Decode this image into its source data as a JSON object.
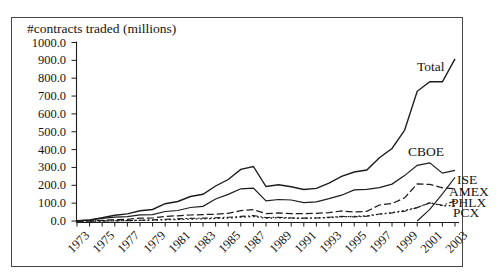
{
  "figure": {
    "title": "#contracts traded (millions)",
    "frame_color": "#474747",
    "line_color": "#1c1c1c"
  },
  "y_axis": {
    "ticks": [
      "1000.0",
      "900.0",
      "800.0",
      "700.0",
      "600.0",
      "500.0",
      "400.0",
      "300.0",
      "200.0",
      "100.0",
      "0.0"
    ]
  },
  "x_axis": {
    "labels": [
      "1973",
      "1975",
      "1977",
      "1979",
      "1981",
      "1983",
      "1985",
      "1987",
      "1989",
      "1991",
      "1993",
      "1995",
      "1997",
      "1999",
      "2001",
      "2003"
    ]
  },
  "series_labels": {
    "total": "Total",
    "cboe": "CBOE",
    "ise": "ISE",
    "amex": "AMEX",
    "phlx": "PHLX",
    "pcx": "PCX"
  },
  "chart_data": {
    "type": "line",
    "title": "#contracts traded (millions)",
    "xlabel": "",
    "ylabel": "#contracts traded (millions)",
    "ylim": [
      0,
      1000
    ],
    "xlim": [
      1973,
      2003
    ],
    "grid": false,
    "legend_position": "inline-annotations",
    "x": [
      1973,
      1974,
      1975,
      1976,
      1977,
      1978,
      1979,
      1980,
      1981,
      1982,
      1983,
      1984,
      1985,
      1986,
      1987,
      1988,
      1989,
      1990,
      1991,
      1992,
      1993,
      1994,
      1995,
      1996,
      1997,
      1998,
      1999,
      2000,
      2001,
      2002,
      2003
    ],
    "series": [
      {
        "name": "Total",
        "line_style": "solid",
        "values": [
          1.1,
          5.7,
          18.1,
          32.4,
          39.6,
          57.2,
          64.3,
          96.7,
          109.4,
          137.3,
          149.4,
          196.1,
          232.5,
          289.2,
          305.1,
          193.0,
          203.5,
          191.4,
          176.2,
          182.7,
          212.4,
          250.2,
          274.5,
          285.8,
          354.7,
          406.3,
          507.9,
          726.7,
          781.2,
          779.8,
          908.4
        ]
      },
      {
        "name": "CBOE",
        "line_style": "solid",
        "values": [
          1.1,
          5.7,
          14.4,
          21.5,
          24.8,
          34.3,
          35.4,
          53.2,
          58.8,
          75.7,
          82.4,
          123.2,
          148.8,
          180.2,
          184.1,
          112.5,
          120.5,
          117.4,
          103.0,
          107.1,
          125.0,
          144.8,
          174.4,
          176.8,
          187.3,
          206.7,
          254.3,
          312.2,
          325.9,
          267.6,
          283.9
        ]
      },
      {
        "name": "ISE",
        "line_style": "solid",
        "values": [
          null,
          null,
          null,
          null,
          null,
          null,
          null,
          null,
          null,
          null,
          null,
          null,
          null,
          null,
          null,
          null,
          null,
          null,
          null,
          null,
          null,
          null,
          null,
          null,
          null,
          null,
          null,
          0.0,
          65.0,
          152.4,
          245.0
        ]
      },
      {
        "name": "AMEX",
        "line_style": "dashed",
        "values": [
          0.0,
          0.0,
          3.5,
          8.0,
          9.8,
          15.5,
          17.0,
          25.7,
          29.4,
          33.8,
          35.8,
          38.3,
          43.2,
          58.1,
          63.5,
          41.5,
          45.0,
          41.0,
          41.7,
          42.6,
          46.9,
          55.9,
          51.1,
          54.0,
          89.9,
          97.2,
          129.7,
          207.6,
          205.1,
          186.0,
          180.1
        ]
      },
      {
        "name": "PHLX",
        "line_style": "dash-dot",
        "values": [
          0.0,
          0.0,
          0.1,
          1.0,
          2.0,
          4.0,
          6.0,
          9.5,
          12.0,
          14.5,
          16.0,
          18.0,
          20.5,
          26.0,
          30.0,
          19.0,
          20.5,
          17.5,
          16.5,
          17.0,
          21.0,
          26.0,
          23.5,
          26.5,
          39.0,
          45.5,
          55.0,
          75.0,
          101.3,
          88.4,
          112.1
        ]
      },
      {
        "name": "PCX",
        "line_style": "dotted",
        "values": [
          0.0,
          0.0,
          0.0,
          1.0,
          2.5,
          3.5,
          4.5,
          6.5,
          8.5,
          10.5,
          12.5,
          14.0,
          16.5,
          21.5,
          25.0,
          16.0,
          17.5,
          15.5,
          15.0,
          16.0,
          19.5,
          23.5,
          25.5,
          28.5,
          38.5,
          46.5,
          59.5,
          75.6,
          102.7,
          85.4,
          86.0
        ]
      }
    ],
    "annotations": [
      "Total",
      "CBOE",
      "ISE",
      "AMEX",
      "PHLX",
      "PCX"
    ]
  }
}
